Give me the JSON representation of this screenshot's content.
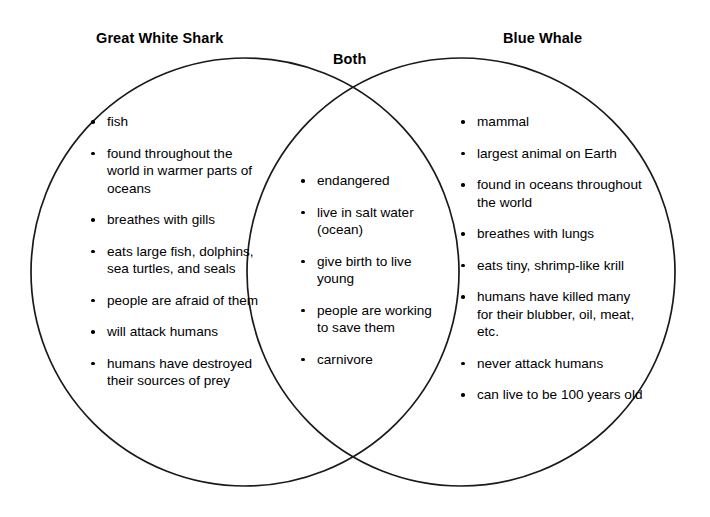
{
  "diagram": {
    "type": "venn",
    "title_left": "Great White Shark",
    "title_center": "Both",
    "title_right": "Blue Whale",
    "stroke_color": "#1a1a1a",
    "text_color": "#000000",
    "background_color": "#ffffff",
    "left_circle": {
      "cx": 245,
      "cy": 272,
      "r": 214
    },
    "right_circle": {
      "cx": 461,
      "cy": 272,
      "r": 214
    },
    "left_items": [
      "fish",
      "found throughout the world in warmer parts of oceans",
      "breathes with gills",
      "eats large fish, dolphins, sea turtles, and seals",
      "people are afraid of them",
      "will attack humans",
      "humans have destroyed their sources of prey"
    ],
    "both_items": [
      "endangered",
      "live in salt water (ocean)",
      "give birth to live young",
      "people are working to save them",
      "carnivore"
    ],
    "right_items": [
      "mammal",
      "largest animal on Earth",
      "found in oceans throughout the world",
      "breathes with lungs",
      "eats tiny, shrimp-like krill",
      "humans have killed many for their blubber, oil, meat, etc.",
      "never attack humans",
      "can live to be 100 years old"
    ]
  }
}
